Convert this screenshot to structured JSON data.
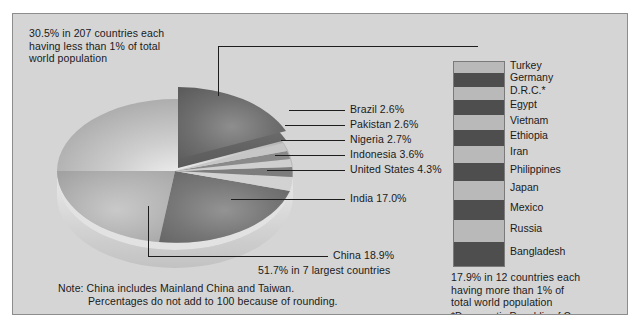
{
  "figure": {
    "background_color": "#d5d5d5",
    "border_color": "#8d8d8d"
  },
  "annotations": {
    "other_countries": "30.5% in 207 countries each\nhaving less than 1% of total\nworld population",
    "seven_largest": "51.7% in 7 largest countries",
    "twelve_countries": "17.9% in 12 countries each\nhaving more than 1% of\ntotal world population",
    "footnote_drc": "*Democratic Republic of Congo",
    "note_line1": "Note: China includes Mainland China and Taiwan.",
    "note_line2": "Percentages do not add to 100 because of rounding."
  },
  "pie_labels": {
    "brazil": "Brazil 2.6%",
    "pakistan": "Pakistan 2.6%",
    "nigeria": "Nigeria 2.7%",
    "indonesia": "Indonesia 3.6%",
    "united_states": "United States 4.3%",
    "india": "India 17.0%",
    "china": "China 18.9%"
  },
  "bar_countries": [
    "Turkey",
    "Germany",
    "D.R.C.*",
    "Egypt",
    "Vietnam",
    "Ethiopia",
    "Iran",
    "Philippines",
    "Japan",
    "Mexico",
    "Russia",
    "Bangladesh"
  ],
  "chart_data": {
    "type": "pie",
    "categories": [
      "China",
      "India",
      "United States",
      "Indonesia",
      "Nigeria",
      "Pakistan",
      "Brazil",
      "207 other countries (<1% each)"
    ],
    "values": [
      18.9,
      17.0,
      4.3,
      3.6,
      2.7,
      2.6,
      2.6,
      30.5
    ],
    "units": "percent of total world population",
    "exploded_slice": "207 other countries (<1% each)",
    "annotations": [
      "51.7% in 7 largest countries",
      "30.5% in 207 countries each having less than 1% of total world population",
      "17.9% in 12 countries each having more than 1% of total world population"
    ],
    "notes": [
      "Note: China includes Mainland China and Taiwan.",
      "Percentages do not add to 100 because of rounding.",
      "*Democratic Republic of Congo"
    ],
    "companion_bar": {
      "type": "bar",
      "title": "17.9% in 12 countries each having more than 1% of total world population",
      "categories": [
        "Turkey",
        "Germany",
        "D.R.C.*",
        "Egypt",
        "Vietnam",
        "Ethiopia",
        "Iran",
        "Philippines",
        "Japan",
        "Mexico",
        "Russia",
        "Bangladesh"
      ],
      "values": [
        1.0,
        1.2,
        1.2,
        1.3,
        1.4,
        1.4,
        1.5,
        1.6,
        1.7,
        1.8,
        2.0,
        2.1
      ],
      "orientation": "vertical-stacked",
      "total": 17.9
    },
    "legend": "none",
    "grid": false
  }
}
